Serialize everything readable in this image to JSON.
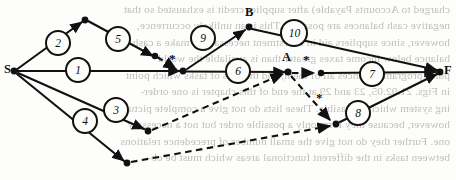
{
  "figure": {
    "type": "activity-on-arrow-network",
    "start_node": "S",
    "end_node": "F",
    "milestone_nodes": [
      "B",
      "A"
    ],
    "node_labels": [
      {
        "name": "S",
        "text": "S",
        "x": 13,
        "y": 71,
        "lx": 4,
        "ly": 62
      },
      {
        "name": "F",
        "text": "F",
        "x": 441,
        "y": 72,
        "lx": 444,
        "ly": 63
      },
      {
        "name": "B",
        "text": "B",
        "x": 249,
        "y": 27,
        "lx": 245,
        "ly": 5
      },
      {
        "name": "A",
        "text": "A",
        "x": 288,
        "y": 72,
        "lx": 283,
        "ly": 50
      }
    ],
    "activity_labels": [
      {
        "id": "1",
        "text": "1",
        "cx": 78,
        "cy": 70,
        "r": 12
      },
      {
        "id": "2",
        "text": "2",
        "cx": 58,
        "cy": 43,
        "r": 12
      },
      {
        "id": "3",
        "text": "3",
        "cx": 116,
        "cy": 110,
        "r": 12
      },
      {
        "id": "4",
        "text": "4",
        "cx": 85,
        "cy": 121,
        "r": 12
      },
      {
        "id": "5",
        "text": "5",
        "cx": 118,
        "cy": 39,
        "r": 12
      },
      {
        "id": "6",
        "text": "6",
        "cx": 238,
        "cy": 71,
        "r": 12
      },
      {
        "id": "7",
        "text": "7",
        "cx": 372,
        "cy": 74,
        "r": 12
      },
      {
        "id": "8",
        "text": "8",
        "cx": 358,
        "cy": 113,
        "r": 12
      },
      {
        "id": "9",
        "text": "9",
        "cx": 203,
        "cy": 38,
        "r": 12
      },
      {
        "id": "10",
        "text": "10",
        "cx": 294,
        "cy": 33,
        "r": 13
      }
    ],
    "dummy_markers": [
      {
        "name": "dummy-star-left",
        "text": "*",
        "x": 170,
        "y": 53
      },
      {
        "name": "dummy-star-center",
        "text": "*",
        "x": 304,
        "y": 54
      },
      {
        "name": "dummy-star-lower",
        "text": "*",
        "x": 317,
        "y": 92
      }
    ],
    "colors": {
      "ink": "#111111",
      "paper": "#fdfdfb",
      "ghost_text": "#2b2b2b"
    }
  },
  "ghost_text": {
    "note": "mirror-image show-through text from the reverse side of the scanned page",
    "lines": [
      "charged to Accounts Payable) after supplier credit is exhausted so that",
      "negative cash balances are possible. This is an unlikely occurrence,",
      "however, since suppliers aid in investment necessary to make a cash",
      "balance below income taxes greater than is available the world",
      "purer program enhances all of them, and the lists of tasks which point",
      "in Figs. 21.92.05, 23 and 29 at the end of this chapter is one order-",
      "ing system which is feasible. These lists do not give a complete picture,",
      "however, because they form only a possible order but not a necessary",
      "one. Further they do not give the small number of precedence relations",
      "between tasks in the different functional areas which must be ob-"
    ]
  }
}
